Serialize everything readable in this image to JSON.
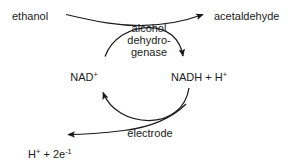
{
  "diagram": {
    "type": "biochemical-cycle",
    "colors": {
      "background": "#ffffff",
      "stroke": "#1a1a1a",
      "text": "#1a1a1a"
    },
    "labels": {
      "substrate": "ethanol",
      "product": "acetaldehyde",
      "enzyme_line1": "alcohol",
      "enzyme_line2": "dehydro-",
      "enzyme_line3": "genase",
      "cofactor_oxidized": "NAD",
      "cofactor_oxidized_charge": "+",
      "cofactor_reduced": "NADH + H",
      "cofactor_reduced_charge": "+",
      "electrode": "electrode",
      "electrode_products_prefix": "H",
      "electrode_products_charge": "+",
      "electrode_products_middle": " + 2e",
      "electrode_products_exponent": "-1"
    },
    "arrows": [
      {
        "name": "substrate-to-product",
        "from": "ethanol",
        "to": "acetaldehyde",
        "direction": "left-to-right"
      },
      {
        "name": "nad-to-nadh",
        "from": "NAD+",
        "to": "NADH + H+",
        "direction": "clockwise-top"
      },
      {
        "name": "nadh-to-nad",
        "from": "NADH + H+",
        "to": "NAD+",
        "direction": "clockwise-bottom"
      },
      {
        "name": "electrode-to-products",
        "from": "electrode",
        "to": "H+ + 2e-1",
        "direction": "right-to-left"
      }
    ]
  }
}
